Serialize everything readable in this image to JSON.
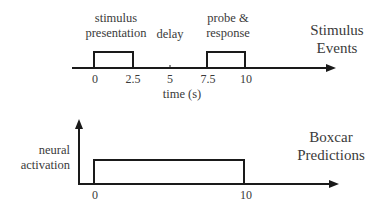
{
  "top_panel": {
    "title_line1": "Stimulus",
    "title_line2": "Events",
    "event_labels": {
      "stimulus_line1": "stimulus",
      "stimulus_line2": "presentation",
      "delay": "delay",
      "probe_line1": "probe &",
      "probe_line2": "response"
    },
    "ticks": [
      "0",
      "2.5",
      "5",
      "7.5",
      "10"
    ],
    "xlabel": "time (s)",
    "events": [
      {
        "name": "stimulus presentation",
        "start": 0,
        "end": 2.5
      },
      {
        "name": "probe & response",
        "start": 7.5,
        "end": 10
      }
    ]
  },
  "bottom_panel": {
    "title_line1": "Boxcar",
    "title_line2": "Predictions",
    "ylabel_line1": "neural",
    "ylabel_line2": "activation",
    "ticks": [
      "0",
      "10"
    ],
    "boxcar": {
      "start": 0,
      "end": 10
    }
  },
  "colors": {
    "line": "#1a1a1a",
    "text": "#3a3a3a"
  }
}
